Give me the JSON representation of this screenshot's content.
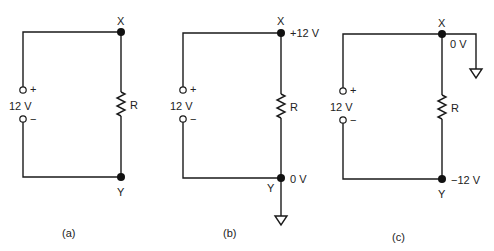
{
  "figure": {
    "panels": [
      {
        "id": "a",
        "caption": "(a)",
        "source": {
          "label": "12 V",
          "plus": "+",
          "minus": "−"
        },
        "resistor": {
          "label": "R"
        },
        "node_top": {
          "label": "X",
          "voltage": ""
        },
        "node_bottom": {
          "label": "Y",
          "voltage": ""
        },
        "ground": "none"
      },
      {
        "id": "b",
        "caption": "(b)",
        "source": {
          "label": "12 V",
          "plus": "+",
          "minus": "−"
        },
        "resistor": {
          "label": "R"
        },
        "node_top": {
          "label": "X",
          "voltage": "+12 V"
        },
        "node_bottom": {
          "label": "Y",
          "voltage": "0 V"
        },
        "ground": "Y"
      },
      {
        "id": "c",
        "caption": "(c)",
        "source": {
          "label": "12 V",
          "plus": "+",
          "minus": "−"
        },
        "resistor": {
          "label": "R"
        },
        "node_top": {
          "label": "X",
          "voltage": "0 V"
        },
        "node_bottom": {
          "label": "Y",
          "voltage": "−12 V"
        },
        "ground": "X"
      }
    ],
    "colors": {
      "line": "#1a1a1a",
      "text": "#222222",
      "background": "#ffffff"
    }
  }
}
